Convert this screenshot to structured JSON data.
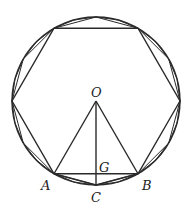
{
  "diagram": {
    "center": {
      "x": 96,
      "y": 101
    },
    "radius": 84,
    "stroke_color": "#2a2a2a",
    "polygons": [
      6,
      12,
      24
    ],
    "labels": {
      "O": "O",
      "A": "A",
      "B": "B",
      "C": "C",
      "G": "G"
    }
  }
}
